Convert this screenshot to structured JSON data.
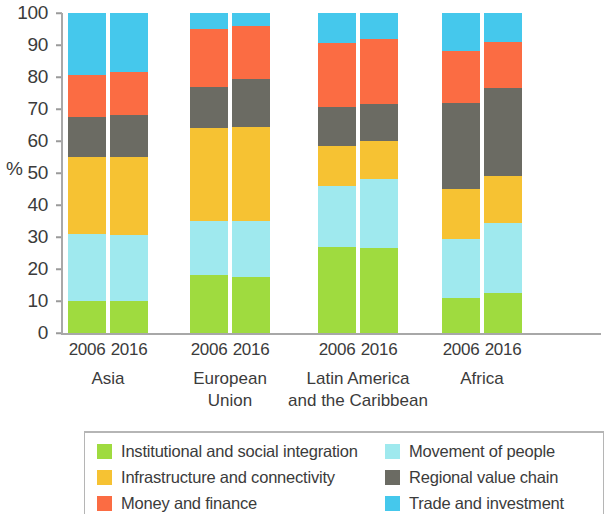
{
  "chart_data": {
    "type": "bar",
    "subtype": "stacked-bar-100",
    "title": "",
    "xlabel": "",
    "ylabel": "%",
    "ylim": [
      0,
      100
    ],
    "yticks": [
      0,
      10,
      20,
      30,
      40,
      50,
      60,
      70,
      80,
      90,
      100
    ],
    "ytick_labels": [
      "0",
      "10",
      "20",
      "30",
      "40",
      "50",
      "60",
      "70",
      "80",
      "90",
      "100"
    ],
    "grid": false,
    "legend_position": "bottom",
    "groups": [
      {
        "name": "Asia",
        "lines": [
          "Asia"
        ],
        "years": [
          "2006",
          "2016"
        ]
      },
      {
        "name": "European Union",
        "lines": [
          "European",
          "Union"
        ],
        "years": [
          "2006",
          "2016"
        ]
      },
      {
        "name": "Latin America and the Caribbean",
        "lines": [
          "Latin America",
          "and the Caribbean"
        ],
        "years": [
          "2006",
          "2016"
        ]
      },
      {
        "name": "Africa",
        "lines": [
          "Africa"
        ],
        "years": [
          "2006",
          "2016"
        ]
      }
    ],
    "categories": [
      "Asia 2006",
      "Asia 2016",
      "European Union 2006",
      "European Union 2016",
      "Latin America and the Caribbean 2006",
      "Latin America and the Caribbean 2016",
      "Africa 2006",
      "Africa 2016"
    ],
    "series": [
      {
        "name": "Institutional and social integration",
        "color": "#9fdb3f",
        "values": [
          10,
          10,
          18,
          17.5,
          27,
          26.5,
          11,
          12.5
        ]
      },
      {
        "name": "Movement of people",
        "color": "#9fe9ee",
        "values": [
          21,
          20.5,
          17,
          17.5,
          19,
          21.5,
          18.5,
          22
        ]
      },
      {
        "name": "Infrastructure and connectivity",
        "color": "#f6c233",
        "values": [
          24,
          24.5,
          29,
          29.5,
          12.5,
          12,
          15.5,
          14.5
        ]
      },
      {
        "name": "Regional value chain",
        "color": "#6b6b63",
        "values": [
          12.5,
          13,
          13,
          15,
          12,
          11.5,
          27,
          27.5
        ]
      },
      {
        "name": "Money and finance",
        "color": "#fb6c43",
        "values": [
          13,
          13.5,
          18,
          16.5,
          20,
          20.5,
          16,
          14.5
        ]
      },
      {
        "name": "Trade and investment",
        "color": "#45c8ec",
        "values": [
          19.5,
          18.5,
          5,
          4,
          9.5,
          8,
          12,
          9
        ]
      }
    ]
  },
  "legend": {
    "left": [
      {
        "label": "Institutional and social integration",
        "color": "#9fdb3f"
      },
      {
        "label": "Infrastructure and connectivity",
        "color": "#f6c233"
      },
      {
        "label": "Money and finance",
        "color": "#fb6c43"
      }
    ],
    "right": [
      {
        "label": "Movement of people",
        "color": "#9fe9ee"
      },
      {
        "label": "Regional value chain",
        "color": "#6b6b63"
      },
      {
        "label": "Trade and investment",
        "color": "#45c8ec"
      }
    ]
  }
}
